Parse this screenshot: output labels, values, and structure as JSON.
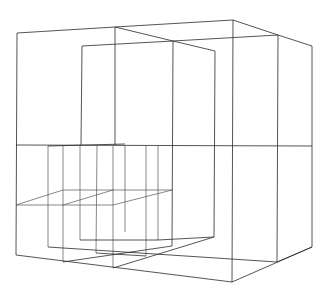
{
  "diagram": {
    "type": "3d-wireframe",
    "stroke_color": "#2a2a2a",
    "background_color": "#ffffff",
    "labels": []
  },
  "segments": {
    "outer_top": [
      [
        17,
        33,
        115,
        27
      ],
      [
        115,
        27,
        233,
        20
      ],
      [
        115,
        27,
        173,
        41
      ],
      [
        233,
        20,
        278,
        35
      ],
      [
        278,
        35,
        312,
        46
      ],
      [
        82,
        46,
        173,
        41
      ],
      [
        173,
        41,
        278,
        35
      ],
      [
        173,
        41,
        215,
        51
      ]
    ],
    "outer_verticals": [
      [
        17,
        33,
        16,
        255
      ],
      [
        115,
        27,
        115,
        145
      ],
      [
        233,
        20,
        232,
        282
      ],
      [
        278,
        35,
        277,
        262
      ],
      [
        312,
        46,
        312,
        247
      ],
      [
        82,
        46,
        81,
        145
      ],
      [
        173,
        41,
        172,
        246
      ],
      [
        215,
        51,
        214,
        237
      ]
    ],
    "mid_plane": [
      [
        16,
        145,
        312,
        146
      ],
      [
        48,
        146,
        125,
        144
      ]
    ],
    "lower_verticals": [
      [
        48,
        146,
        48,
        247
      ],
      [
        63,
        146,
        63,
        262
      ],
      [
        80,
        146,
        80,
        240
      ],
      [
        97,
        146,
        96,
        253
      ],
      [
        113,
        146,
        113,
        268
      ],
      [
        125,
        146,
        125,
        232
      ],
      [
        146,
        146,
        146,
        256
      ],
      [
        158,
        146,
        158,
        240
      ]
    ],
    "lower_grid": [
      [
        16,
        205,
        63,
        190
      ],
      [
        63,
        190,
        172,
        190
      ],
      [
        16,
        205,
        113,
        205
      ],
      [
        63,
        205,
        113,
        190
      ],
      [
        113,
        205,
        172,
        190
      ]
    ],
    "bottom": [
      [
        16,
        255,
        232,
        282
      ],
      [
        232,
        282,
        312,
        247
      ],
      [
        48,
        247,
        277,
        262
      ],
      [
        63,
        262,
        172,
        246
      ],
      [
        113,
        268,
        214,
        237
      ],
      [
        80,
        240,
        158,
        240
      ],
      [
        158,
        240,
        214,
        237
      ],
      [
        277,
        262,
        312,
        247
      ],
      [
        96,
        253,
        146,
        256
      ]
    ]
  }
}
